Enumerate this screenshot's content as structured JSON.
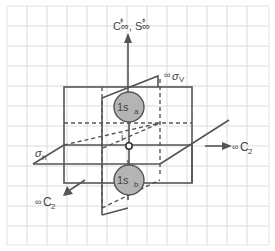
{
  "diagram": {
    "colors": {
      "grid": "#dcdcdc",
      "lines": "#555555",
      "orbital_fill": "#b4b4b4",
      "text": "#444444",
      "background": "#ffffff"
    },
    "labels": {
      "principal_axis": "C∞, S∞",
      "principal_axis_sup1": "ϕ",
      "principal_axis_sup2": "ϕ",
      "vertical_plane_prefix": "∞",
      "vertical_plane": "σ",
      "vertical_plane_sub": "V",
      "horizontal_plane": "σ",
      "horizontal_plane_sub": "h",
      "inversion_center": "i",
      "c2_right_prefix": "∞",
      "c2_right": "C",
      "c2_right_sub": "2",
      "c2_front_prefix": "∞",
      "c2_front": "C",
      "c2_front_sub": "2",
      "orbital_top": "1s",
      "orbital_top_sub": "a",
      "orbital_bottom": "1s",
      "orbital_bottom_sub": "b"
    }
  }
}
